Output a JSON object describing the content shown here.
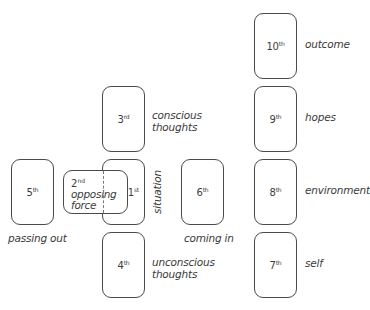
{
  "diagram": {
    "type": "tarot-spread-celtic-cross",
    "cards": [
      {
        "position": "1",
        "suffix": "st",
        "label": "situation"
      },
      {
        "position": "2",
        "suffix": "nd",
        "label": "opposing force",
        "label_line1": "opposing",
        "label_line2": "force"
      },
      {
        "position": "3",
        "suffix": "rd",
        "label": "conscious thoughts",
        "label_line1": "conscious",
        "label_line2": "thoughts"
      },
      {
        "position": "4",
        "suffix": "th",
        "label": "unconscious thoughts",
        "label_line1": "unconscious",
        "label_line2": "thoughts"
      },
      {
        "position": "5",
        "suffix": "th",
        "label": "passing out"
      },
      {
        "position": "6",
        "suffix": "th",
        "label": "coming in"
      },
      {
        "position": "7",
        "suffix": "th",
        "label": "self"
      },
      {
        "position": "8",
        "suffix": "th",
        "label": "environment"
      },
      {
        "position": "9",
        "suffix": "th",
        "label": "hopes"
      },
      {
        "position": "10",
        "suffix": "th",
        "label": "outcome"
      }
    ]
  }
}
